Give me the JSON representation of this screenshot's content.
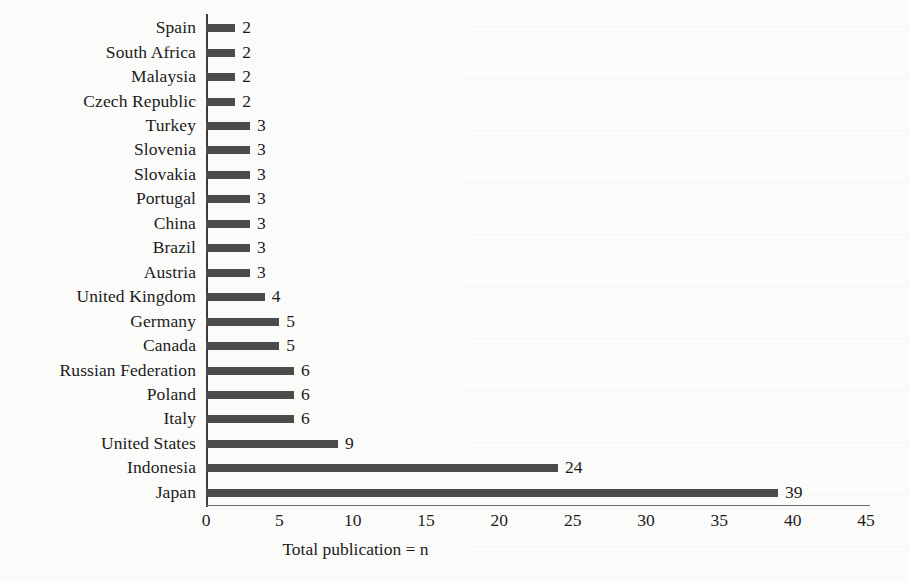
{
  "chart_data": {
    "type": "bar",
    "orientation": "horizontal",
    "title": "",
    "xlabel": "Total publication = n",
    "ylabel": "",
    "xlim": [
      0,
      45
    ],
    "xticks": [
      0,
      5,
      10,
      15,
      20,
      25,
      30,
      35,
      40,
      45
    ],
    "grid": false,
    "legend": false,
    "bar_color": "#4b4b4b",
    "axis_color": "#3c3c3c",
    "show_value_labels": true,
    "categories": [
      "Spain",
      "South Africa",
      "Malaysia",
      "Czech Republic",
      "Turkey",
      "Slovenia",
      "Slovakia",
      "Portugal",
      "China",
      "Brazil",
      "Austria",
      "United Kingdom",
      "Germany",
      "Canada",
      "Russian Federation",
      "Poland",
      "Italy",
      "United States",
      "Indonesia",
      "Japan"
    ],
    "values": [
      2,
      2,
      2,
      2,
      3,
      3,
      3,
      3,
      3,
      3,
      3,
      4,
      5,
      5,
      6,
      6,
      6,
      9,
      24,
      39
    ]
  }
}
